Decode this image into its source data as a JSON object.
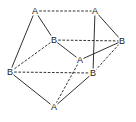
{
  "diagram": {
    "type": "polyhedron-graph",
    "nodes": [
      {
        "id": "n1",
        "label": "A",
        "x": 35,
        "y": 11
      },
      {
        "id": "n2",
        "label": "A",
        "x": 95,
        "y": 11
      },
      {
        "id": "n3",
        "label": "B",
        "x": 54,
        "y": 40
      },
      {
        "id": "n4",
        "label": "B",
        "x": 122,
        "y": 41
      },
      {
        "id": "n5",
        "label": "A",
        "x": 80,
        "y": 60
      },
      {
        "id": "n6",
        "label": "B",
        "x": 10,
        "y": 72
      },
      {
        "id": "n7",
        "label": "B",
        "x": 93,
        "y": 73
      },
      {
        "id": "n8",
        "label": "A",
        "x": 54,
        "y": 107
      }
    ],
    "edges": [
      {
        "from": "n1",
        "to": "n2",
        "style": "dashed"
      },
      {
        "from": "n1",
        "to": "n6",
        "style": "solid"
      },
      {
        "from": "n1",
        "to": "n3",
        "style": "solid"
      },
      {
        "from": "n2",
        "to": "n4",
        "style": "solid"
      },
      {
        "from": "n2",
        "to": "n7",
        "style": "solid"
      },
      {
        "from": "n3",
        "to": "n4",
        "style": "dashed"
      },
      {
        "from": "n3",
        "to": "n5",
        "style": "solid"
      },
      {
        "from": "n3",
        "to": "n6",
        "style": "dashed"
      },
      {
        "from": "n5",
        "to": "n4",
        "style": "solid"
      },
      {
        "from": "n4",
        "to": "n7",
        "style": "dashed"
      },
      {
        "from": "n6",
        "to": "n7",
        "style": "dashed"
      },
      {
        "from": "n6",
        "to": "n8",
        "style": "solid"
      },
      {
        "from": "n8",
        "to": "n7",
        "style": "solid"
      },
      {
        "from": "n8",
        "to": "n5",
        "style": "dashed"
      }
    ]
  }
}
